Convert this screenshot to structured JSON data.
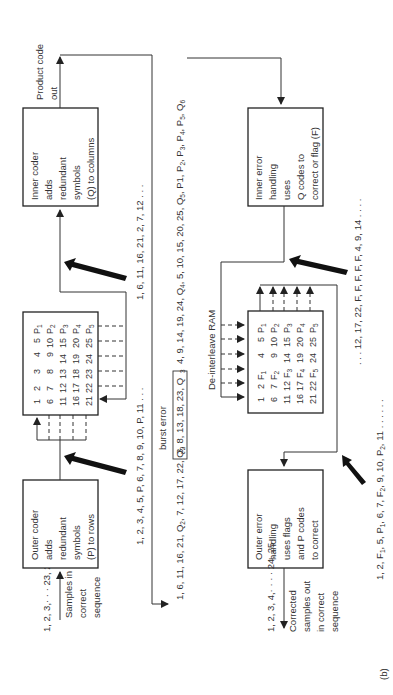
{
  "figure_label": "(b)",
  "encoder": {
    "input_label": "1, 2, 3,· · · 23, 24, 25",
    "input_caption": [
      "Samples in",
      "correct",
      "sequence"
    ],
    "outer_coder": [
      "Outer coder",
      "adds",
      "redundant",
      "symbols",
      "(P) to rows"
    ],
    "outer_output_sequence": "1, 2, 3, 4, 5, P, 6, 7, 8, 9, 10, P, 11 . . .",
    "interleave_matrix": [
      [
        "1",
        "2",
        "3",
        "4",
        "5",
        "P1"
      ],
      [
        "6",
        "7",
        "8",
        "9",
        "10",
        "P2"
      ],
      [
        "11",
        "12",
        "13",
        "14",
        "15",
        "P3"
      ],
      [
        "16",
        "17",
        "18",
        "19",
        "20",
        "P4"
      ],
      [
        "21",
        "22",
        "23",
        "24",
        "25",
        "P5"
      ]
    ],
    "interleave_output_sequence": "1, 6, 11, 16, 21, 2, 7, 12 . . .",
    "inner_coder": [
      "Inner coder",
      "adds",
      "redundant",
      "symbols",
      "(Q) to columns"
    ],
    "output_caption": [
      "Product code",
      "out"
    ]
  },
  "channel": {
    "transmitted_sequence_part1": "1, 6, 11, 16, 21, Q",
    "transmitted_sequence_part2": ", 7, 12, 17, 22, Q",
    "burst_error_label": "burst error",
    "burst_content": "3, 8, 13, 18, 23, Q",
    "transmitted_sequence_part3": "4, 9, 14, 19, 24, Q",
    "transmitted_sequence_part4": ", 5, 10, 15, 20, 25, Q",
    "transmitted_sequence_part5": ", P1, P",
    "transmitted_sequence_part6": ", P",
    "transmitted_sequence_part7": ", P",
    "transmitted_sequence_part8": ", P",
    "transmitted_sequence_part9": ", Q"
  },
  "decoder": {
    "inner_error_handling": [
      "Inner error",
      "handling",
      "uses",
      "Q codes to",
      "correct or flag (F)"
    ],
    "inner_output_sequence": ". . . 12, 17, 22, F, F, F, F, F, 4, 9, 14 . . . .",
    "deinterleave_label": "De-interleave RAM",
    "deinterleave_matrix": [
      [
        "1",
        "2",
        "F1",
        "4",
        "5",
        "P1"
      ],
      [
        "6",
        "7",
        "F2",
        "9",
        "10",
        "P2"
      ],
      [
        "11",
        "12",
        "F3",
        "14",
        "15",
        "P3"
      ],
      [
        "16",
        "17",
        "F4",
        "19",
        "20",
        "P4"
      ],
      [
        "21",
        "22",
        "F5",
        "24",
        "25",
        "P5"
      ]
    ],
    "deinterleave_output_sequence": "1, 2, F1, 5, P1, 6, 7, F2, 9, 10, P2, 11 . . . . . .",
    "outer_error_handling": [
      "Outer error",
      "handling",
      "uses flags",
      "and P codes",
      "to correct"
    ],
    "output_label": "1, 2, 3, 4,· · · · 24, 25",
    "output_caption": [
      "Corrected",
      "samples out",
      "in correct",
      "sequence"
    ]
  }
}
